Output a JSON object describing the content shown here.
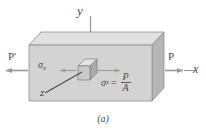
{
  "figure": {
    "caption": "(a)",
    "axes": {
      "y_label": "y",
      "x_label": "x",
      "z_label": "z"
    },
    "forces": {
      "right_label": "P",
      "left_label": "P'"
    },
    "stress": {
      "left_symbol": "σ",
      "left_subscript": "x",
      "equation_symbol": "σ",
      "equation_subscript": "x",
      "equals": "=",
      "numerator": "P",
      "denominator": "A"
    },
    "colors": {
      "block_front": "#d2d2d2",
      "block_top": "#e0e0e0",
      "block_side": "#b9b9b9",
      "cube_front": "#c8c8c8",
      "cube_top": "#e2e2e2",
      "cube_side": "#aeaeae",
      "outline": "#8f8f8f",
      "ink": "#4a4a4a",
      "arrow": "#9a9a9a",
      "background": "#ffffff"
    }
  }
}
